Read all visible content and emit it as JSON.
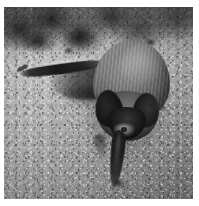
{
  "image": {
    "subject": "bat",
    "scene_description": "A small bat lying on a speckled concrete surface, viewed from above, with one wing stretched out to the left and its tail extending downward.",
    "medium": "grayscale photograph",
    "orientation": "portrait",
    "frame": {
      "canvas_width_px": 199,
      "canvas_height_px": 206,
      "photo_left_px": 4,
      "photo_top_px": 7,
      "photo_width_px": 189,
      "photo_height_px": 192,
      "margin_color": "#ffffff"
    },
    "palette": {
      "background_light": "#b4b3b0",
      "background_mid": "#9a9a9a",
      "background_dark": "#6e6e6e",
      "subject_fur": "#85807a",
      "subject_shadow": "#2e2b28",
      "subject_darkest": "#0b0a09",
      "highlight": "#cdc8c1"
    },
    "regions": [
      {
        "name": "top-debris",
        "label": "dark mottled debris band across the top of the frame"
      },
      {
        "name": "ground",
        "label": "speckled gray concrete ground"
      },
      {
        "name": "bat-body",
        "label": "furry back of the bat"
      },
      {
        "name": "bat-head",
        "label": "head with two dark ears"
      },
      {
        "name": "bat-wing",
        "label": "outstretched left wing and forearm"
      },
      {
        "name": "bat-tail",
        "label": "tail and hind leg extending downward"
      }
    ]
  }
}
